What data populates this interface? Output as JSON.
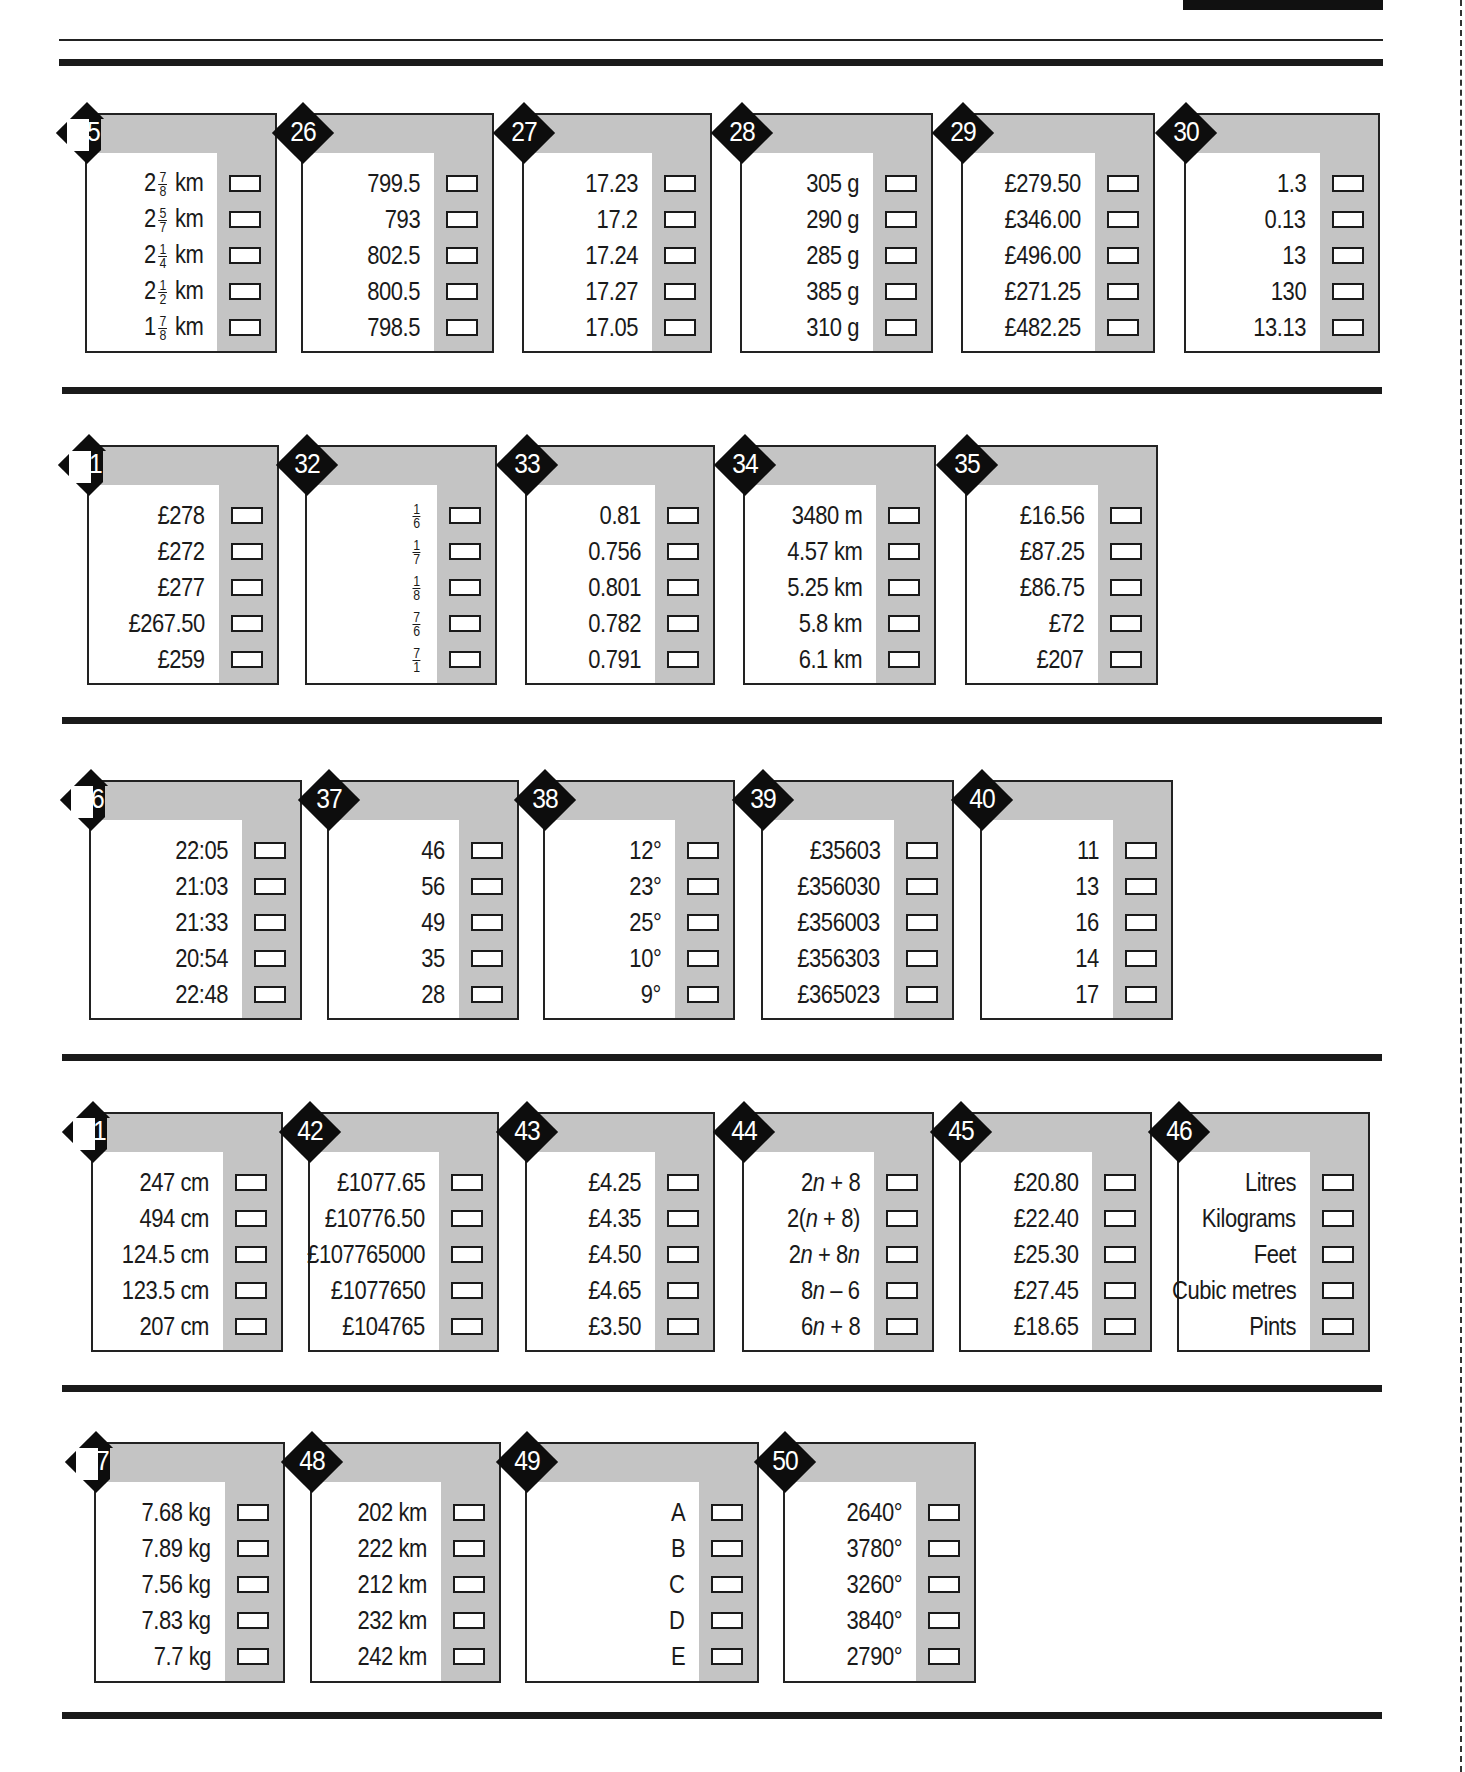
{
  "page": {
    "accent_colors": {
      "ink": "#1a1a1a",
      "panel_gray": "#c4c4c4",
      "paper": "#ffffff"
    },
    "rows": [
      {
        "separator_y": 390,
        "questions": [
          {
            "number": "25",
            "number_obscured": true,
            "x": 85,
            "y": 113,
            "w": 192,
            "h": 240,
            "whole_parts": [
              "2",
              "2",
              "2",
              "2",
              "1"
            ],
            "options": [
              "2 7/8 km",
              "2 5/7 km",
              "2 1/4 km",
              "2 1/2 km",
              "1 7/8 km"
            ]
          },
          {
            "number": "26",
            "x": 301,
            "y": 113,
            "w": 193,
            "h": 240,
            "options": [
              "799.5",
              "793",
              "802.5",
              "800.5",
              "798.5"
            ]
          },
          {
            "number": "27",
            "x": 522,
            "y": 113,
            "w": 190,
            "h": 240,
            "options": [
              "17.23",
              "17.2",
              "17.24",
              "17.27",
              "17.05"
            ]
          },
          {
            "number": "28",
            "x": 740,
            "y": 113,
            "w": 193,
            "h": 240,
            "options": [
              "305 g",
              "290 g",
              "285 g",
              "385 g",
              "310 g"
            ]
          },
          {
            "number": "29",
            "x": 961,
            "y": 113,
            "w": 194,
            "h": 240,
            "options": [
              "£279.50",
              "£346.00",
              "£496.00",
              "£271.25",
              "£482.25"
            ]
          },
          {
            "number": "30",
            "x": 1184,
            "y": 113,
            "w": 196,
            "h": 240,
            "options": [
              "1.3",
              "0.13",
              "13",
              "130",
              "13.13"
            ]
          }
        ]
      },
      {
        "separator_y": 720,
        "questions": [
          {
            "number": "31",
            "number_obscured": true,
            "x": 87,
            "y": 445,
            "w": 192,
            "h": 240,
            "options": [
              "£278",
              "£272",
              "£277",
              "£267.50",
              "£259"
            ]
          },
          {
            "number": "32",
            "x": 305,
            "y": 445,
            "w": 192,
            "h": 240,
            "options": [
              "1/6",
              "1/7",
              "1/8",
              "7/6",
              "7/1"
            ]
          },
          {
            "number": "33",
            "x": 525,
            "y": 445,
            "w": 190,
            "h": 240,
            "options": [
              "0.81",
              "0.756",
              "0.801",
              "0.782",
              "0.791"
            ]
          },
          {
            "number": "34",
            "x": 743,
            "y": 445,
            "w": 193,
            "h": 240,
            "options": [
              "3480 m",
              "4.57 km",
              "5.25 km",
              "5.8 km",
              "6.1 km"
            ]
          },
          {
            "number": "35",
            "x": 965,
            "y": 445,
            "w": 193,
            "h": 240,
            "options": [
              "£16.56",
              "£87.25",
              "£86.75",
              "£72",
              "£207"
            ]
          }
        ]
      },
      {
        "separator_y": 1057,
        "questions": [
          {
            "number": "36",
            "number_obscured": true,
            "x": 89,
            "y": 780,
            "w": 213,
            "h": 240,
            "options": [
              "22:05",
              "21:03",
              "21:33",
              "20:54",
              "22:48"
            ]
          },
          {
            "number": "37",
            "x": 327,
            "y": 780,
            "w": 192,
            "h": 240,
            "options": [
              "46",
              "56",
              "49",
              "35",
              "28"
            ]
          },
          {
            "number": "38",
            "x": 543,
            "y": 780,
            "w": 192,
            "h": 240,
            "options": [
              "12°",
              "23°",
              "25°",
              "10°",
              "9°"
            ]
          },
          {
            "number": "39",
            "x": 761,
            "y": 780,
            "w": 193,
            "h": 240,
            "options": [
              "£35603",
              "£356030",
              "£356003",
              "£356303",
              "£365023"
            ]
          },
          {
            "number": "40",
            "x": 980,
            "y": 780,
            "w": 193,
            "h": 240,
            "options": [
              "11",
              "13",
              "16",
              "14",
              "17"
            ]
          }
        ]
      },
      {
        "separator_y": 1388,
        "questions": [
          {
            "number": "41",
            "number_obscured": true,
            "x": 91,
            "y": 1112,
            "w": 192,
            "h": 240,
            "options": [
              "247 cm",
              "494 cm",
              "124.5 cm",
              "123.5 cm",
              "207 cm"
            ]
          },
          {
            "number": "42",
            "x": 308,
            "y": 1112,
            "w": 191,
            "h": 240,
            "options": [
              "£1077.65",
              "£10776.50",
              "£107765000",
              "£1077650",
              "£104765"
            ]
          },
          {
            "number": "43",
            "x": 525,
            "y": 1112,
            "w": 190,
            "h": 240,
            "options": [
              "£4.25",
              "£4.35",
              "£4.50",
              "£4.65",
              "£3.50"
            ]
          },
          {
            "number": "44",
            "x": 742,
            "y": 1112,
            "w": 192,
            "h": 240,
            "options": [
              "2n + 8",
              "2(n + 8)",
              "2n + 8n",
              "8n – 6",
              "6n + 8"
            ]
          },
          {
            "number": "45",
            "x": 959,
            "y": 1112,
            "w": 193,
            "h": 240,
            "options": [
              "£20.80",
              "£22.40",
              "£25.30",
              "£27.45",
              "£18.65"
            ]
          },
          {
            "number": "46",
            "x": 1177,
            "y": 1112,
            "w": 193,
            "h": 240,
            "options": [
              "Litres",
              "Kilograms",
              "Feet",
              "Cubic metres",
              "Pints"
            ]
          }
        ]
      },
      {
        "separator_y": 1715,
        "questions": [
          {
            "number": "47",
            "number_obscured": true,
            "x": 94,
            "y": 1442,
            "w": 191,
            "h": 241,
            "options": [
              "7.68 kg",
              "7.89 kg",
              "7.56 kg",
              "7.83 kg",
              "7.7 kg"
            ]
          },
          {
            "number": "48",
            "x": 310,
            "y": 1442,
            "w": 191,
            "h": 241,
            "options": [
              "202 km",
              "222 km",
              "212 km",
              "232 km",
              "242 km"
            ]
          },
          {
            "number": "49",
            "x": 525,
            "y": 1442,
            "w": 234,
            "h": 241,
            "options": [
              "A",
              "B",
              "C",
              "D",
              "E"
            ]
          },
          {
            "number": "50",
            "x": 783,
            "y": 1442,
            "w": 193,
            "h": 241,
            "options": [
              "2640°",
              "3780°",
              "3260°",
              "3840°",
              "2790°"
            ]
          }
        ]
      }
    ]
  }
}
